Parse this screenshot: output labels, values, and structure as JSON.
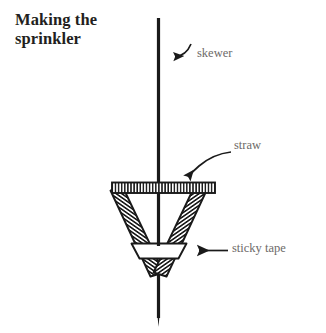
{
  "figure": {
    "title": {
      "line1": "Making the",
      "line2": "sprinkler",
      "full": "Making the sprinkler"
    },
    "background_color": "#ffffff",
    "ink_color": "#1a1a1a",
    "label_color": "#6d6a68",
    "callouts": [
      {
        "id": "skewer",
        "label": "skewer",
        "pointer": "curved-arrow-left",
        "points_to": "vertical-skewer-rod"
      },
      {
        "id": "straw",
        "label": "straw",
        "pointer": "curved-arrow-down-left",
        "points_to": "angled-straw-arm"
      },
      {
        "id": "sticky-tape",
        "label": "sticky tape",
        "pointer": "straight-arrow-left",
        "points_to": "tape-band"
      }
    ],
    "parts": [
      {
        "id": "skewer-rod",
        "name": "skewer",
        "description": "vertical wooden skewer with pointed lower tip"
      },
      {
        "id": "top-straw",
        "name": "straw",
        "description": "horizontal hatched straw across the top of the cone"
      },
      {
        "id": "left-straw",
        "name": "straw",
        "description": "left angled hatched straw arm"
      },
      {
        "id": "right-straw",
        "name": "straw",
        "description": "right angled hatched straw arm"
      },
      {
        "id": "tape-band",
        "name": "sticky tape",
        "description": "white tape band wrapped near the cone apex"
      }
    ]
  }
}
